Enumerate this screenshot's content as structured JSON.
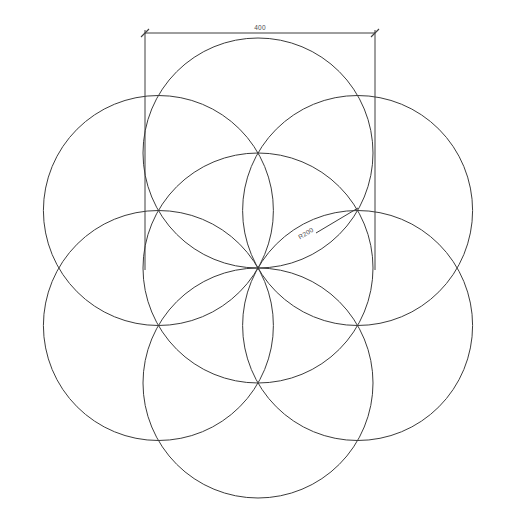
{
  "drawing": {
    "title": "Flower of Life",
    "background_color": "#ffffff",
    "line_color": "#3c3c3c",
    "text_color": "#4a4a4a"
  },
  "dimensions": {
    "width_label": "400",
    "radius_label": "R200"
  },
  "chart_data": {
    "type": "diagram",
    "shape": "seven-circle-rosette",
    "units": "mm",
    "circle_radius_value": 200,
    "overall_width_value": 400,
    "circle_count": 7,
    "center_px": [
      258,
      268
    ],
    "radius_px": 115,
    "circles_px": [
      {
        "name": "center",
        "cx": 258,
        "cy": 268,
        "r": 115
      },
      {
        "name": "top",
        "cx": 258,
        "cy": 153,
        "r": 115
      },
      {
        "name": "upper-right",
        "cx": 357.6,
        "cy": 210.5,
        "r": 115
      },
      {
        "name": "lower-right",
        "cx": 357.6,
        "cy": 325.5,
        "r": 115
      },
      {
        "name": "bottom",
        "cx": 258,
        "cy": 383,
        "r": 115
      },
      {
        "name": "lower-left",
        "cx": 158.4,
        "cy": 325.5,
        "r": 115
      },
      {
        "name": "upper-left",
        "cx": 158.4,
        "cy": 210.5,
        "r": 115
      }
    ],
    "annotations": [
      {
        "kind": "linear-dimension",
        "text": "400",
        "from_px": [
          145,
          33
        ],
        "to_px": [
          375,
          33
        ],
        "extension_bottom_y": 270
      },
      {
        "kind": "radial-dimension",
        "text": "R200",
        "leader_from_px": [
          358,
          208
        ],
        "leader_to_px": [
          316,
          233
        ],
        "text_rotation_deg": -31
      }
    ]
  }
}
